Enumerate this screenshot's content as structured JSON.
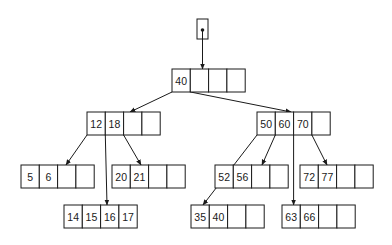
{
  "diagram": {
    "type": "b-tree",
    "root_pointer": {
      "label": "root-pointer"
    },
    "nodes": [
      {
        "id": "root",
        "keys": [
          "40",
          "",
          "",
          ""
        ]
      },
      {
        "id": "n12",
        "keys": [
          "12",
          "18",
          "",
          ""
        ]
      },
      {
        "id": "n50",
        "keys": [
          "50",
          "60",
          "70",
          ""
        ]
      },
      {
        "id": "l5",
        "keys": [
          "5",
          "6",
          "",
          ""
        ]
      },
      {
        "id": "l14",
        "keys": [
          "14",
          "15",
          "16",
          "17"
        ]
      },
      {
        "id": "l20",
        "keys": [
          "20",
          "21",
          "",
          ""
        ]
      },
      {
        "id": "l35",
        "keys": [
          "35",
          "40",
          "",
          ""
        ]
      },
      {
        "id": "l52",
        "keys": [
          "52",
          "56",
          "",
          ""
        ]
      },
      {
        "id": "l63",
        "keys": [
          "63",
          "66",
          "",
          ""
        ]
      },
      {
        "id": "l72",
        "keys": [
          "72",
          "77",
          "",
          ""
        ]
      }
    ],
    "edges": [
      {
        "from": "ptr",
        "to": "root"
      },
      {
        "from": "root",
        "to": "n12"
      },
      {
        "from": "root",
        "to": "n50"
      },
      {
        "from": "n12",
        "to": "l5"
      },
      {
        "from": "n12",
        "to": "l14"
      },
      {
        "from": "n12",
        "to": "l20"
      },
      {
        "from": "n50",
        "to": "l35"
      },
      {
        "from": "n50",
        "to": "l52"
      },
      {
        "from": "n50",
        "to": "l63"
      },
      {
        "from": "n50",
        "to": "l72"
      }
    ]
  }
}
